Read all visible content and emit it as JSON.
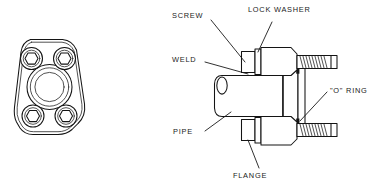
{
  "figure": {
    "background_color": "#ffffff",
    "line_color": "#141414",
    "text_color": "#1a1a1a",
    "views": [
      {
        "name": "flange-face-view",
        "description": "Front face view of flange plate with four hex-socket bolt holes and concentric center bore"
      },
      {
        "name": "assembly-section-view",
        "description": "Cross-section of pipe welded to flange with screws, lock washers and O-ring"
      }
    ]
  },
  "labels": {
    "screw": "SCREW",
    "lock_washer": "LOCK WASHER",
    "weld": "WELD",
    "pipe": "PIPE",
    "o_ring": "\"O\" RING",
    "flange": "FLANGE"
  },
  "face_view": {
    "bolt_hole_count": 4,
    "center_bore_ring_count": 3,
    "bolt_hole_socket": "hexagon"
  },
  "section_view": {
    "screw_count": 2,
    "thread_hatch": true,
    "o_ring_marks": 2
  }
}
